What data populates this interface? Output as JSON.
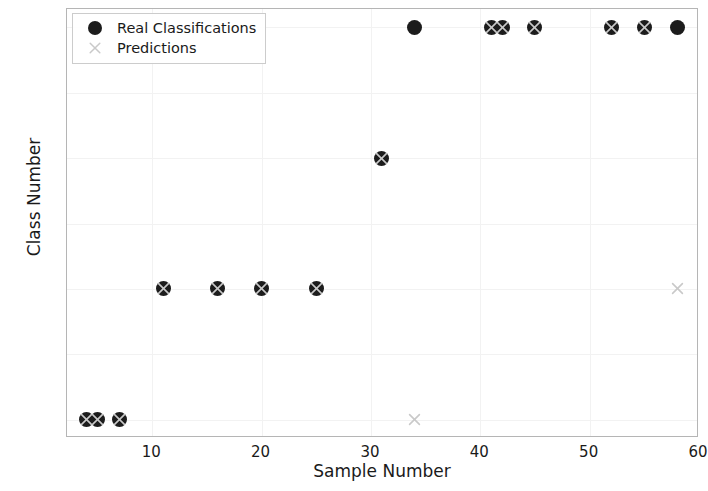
{
  "chart_data": {
    "type": "scatter",
    "title": "",
    "xlabel": "Sample Number",
    "ylabel": "Class Number",
    "xlim": [
      2.2,
      60.0
    ],
    "ylim": [
      0.86,
      4.14
    ],
    "xticks": [
      10,
      20,
      30,
      40,
      50,
      60
    ],
    "yticks": [
      "1.0",
      "1.5",
      "2.0",
      "2.5",
      "3.0",
      "3.5",
      "4.0"
    ],
    "grid": true,
    "legend_position": "upper left",
    "series": [
      {
        "name": "Real Classifications",
        "marker": "circle",
        "color": "#1c1c1c",
        "points": [
          {
            "x": 4,
            "y": 1
          },
          {
            "x": 5,
            "y": 1
          },
          {
            "x": 7,
            "y": 1
          },
          {
            "x": 11,
            "y": 2
          },
          {
            "x": 16,
            "y": 2
          },
          {
            "x": 20,
            "y": 2
          },
          {
            "x": 25,
            "y": 2
          },
          {
            "x": 31,
            "y": 3
          },
          {
            "x": 34,
            "y": 4
          },
          {
            "x": 41,
            "y": 4
          },
          {
            "x": 42,
            "y": 4
          },
          {
            "x": 45,
            "y": 4
          },
          {
            "x": 52,
            "y": 4
          },
          {
            "x": 55,
            "y": 4
          },
          {
            "x": 58,
            "y": 4
          }
        ]
      },
      {
        "name": "Predictions",
        "marker": "x",
        "color": "#c9c9c9",
        "points": [
          {
            "x": 4,
            "y": 1
          },
          {
            "x": 5,
            "y": 1
          },
          {
            "x": 7,
            "y": 1
          },
          {
            "x": 11,
            "y": 2
          },
          {
            "x": 16,
            "y": 2
          },
          {
            "x": 20,
            "y": 2
          },
          {
            "x": 25,
            "y": 2
          },
          {
            "x": 31,
            "y": 3
          },
          {
            "x": 34,
            "y": 1
          },
          {
            "x": 41,
            "y": 4
          },
          {
            "x": 42,
            "y": 4
          },
          {
            "x": 45,
            "y": 4
          },
          {
            "x": 52,
            "y": 4
          },
          {
            "x": 55,
            "y": 4
          },
          {
            "x": 58,
            "y": 2
          }
        ]
      }
    ]
  },
  "legend": {
    "entries": [
      {
        "label": "Real Classifications",
        "icon": "filled-circle-marker"
      },
      {
        "label": "Predictions",
        "icon": "x-cross-marker"
      }
    ]
  }
}
